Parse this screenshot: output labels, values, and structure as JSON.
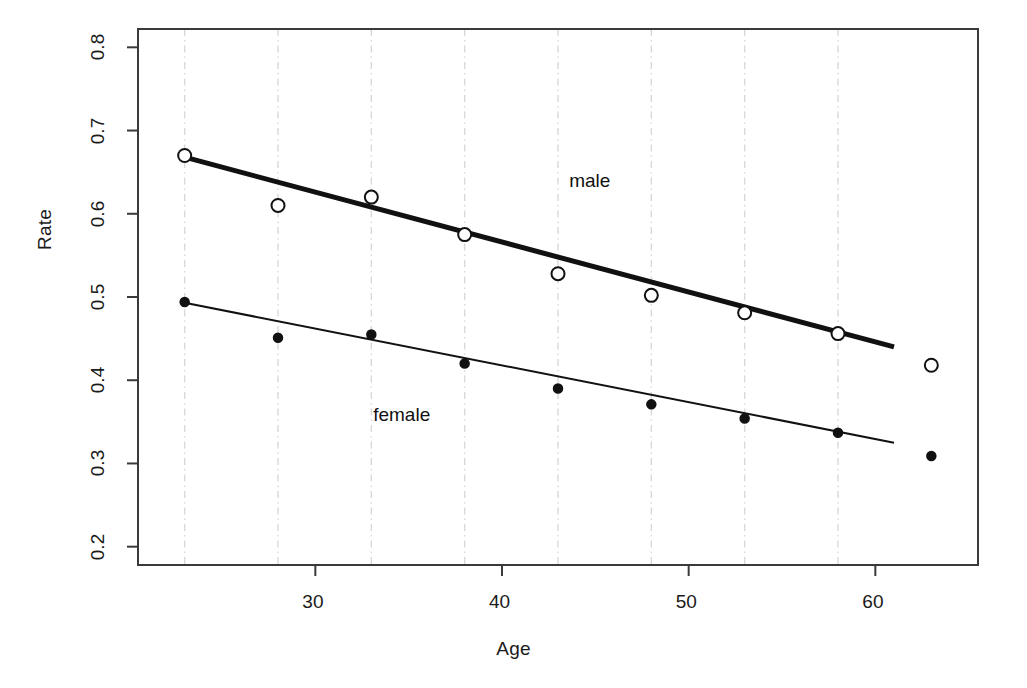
{
  "chart_data": {
    "type": "scatter",
    "title": "",
    "xlabel": "Age",
    "ylabel": "Rate",
    "xlim": [
      20.5,
      65.5
    ],
    "ylim": [
      0.178,
      0.822
    ],
    "xticks": [
      30,
      40,
      50,
      60
    ],
    "xticklabels": [
      "30",
      "40",
      "50",
      "60"
    ],
    "yticks": [
      0.2,
      0.3,
      0.4,
      0.5,
      0.6,
      0.7,
      0.8
    ],
    "yticklabels": [
      "0.2",
      "0.3",
      "0.4",
      "0.5",
      "0.6",
      "0.7",
      "0.8"
    ],
    "grid": "vertical-dashdot-at-data-ages",
    "gridlines_x": [
      23,
      28,
      33,
      38,
      43,
      48,
      53,
      58
    ],
    "legend": "inline-annotations",
    "x": [
      23,
      28,
      33,
      38,
      43,
      48,
      53,
      58,
      63
    ],
    "series": [
      {
        "name": "male",
        "marker": "open-circle",
        "values": [
          0.67,
          0.61,
          0.62,
          0.575,
          0.528,
          0.502,
          0.481,
          0.456,
          0.418
        ],
        "fit_line": {
          "x": [
            23,
            61
          ],
          "y": [
            0.668,
            0.44
          ],
          "width": 5
        }
      },
      {
        "name": "female",
        "marker": "filled-circle",
        "values": [
          0.494,
          0.451,
          0.455,
          0.42,
          0.39,
          0.371,
          0.354,
          0.337,
          0.309
        ],
        "fit_line": {
          "x": [
            23,
            61
          ],
          "y": [
            0.493,
            0.325
          ],
          "width": 2
        }
      }
    ],
    "annotations": [
      {
        "text": "male",
        "x": 43.6,
        "y": 0.638
      },
      {
        "text": "female",
        "x": 33.1,
        "y": 0.357
      }
    ],
    "colors": {
      "ink": "#111111",
      "grid": "#d9d9d9",
      "axis": "#3a3a3a",
      "background": "#ffffff"
    }
  },
  "axes": {
    "x_title": "Age",
    "y_title": "Rate"
  }
}
